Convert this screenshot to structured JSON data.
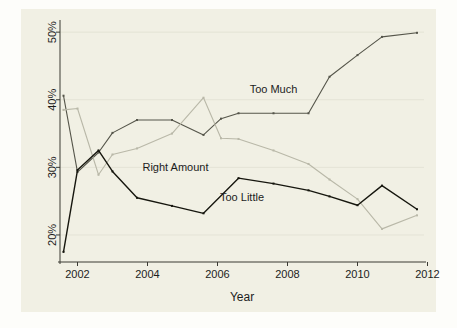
{
  "chart_data": {
    "type": "line",
    "title": "",
    "subtitle": "",
    "xlabel": "Year",
    "ylabel": "",
    "xlim": [
      2001.5,
      2011.9
    ],
    "ylim": [
      16.0,
      51.5
    ],
    "grid": true,
    "grid_axis": "y",
    "legend": "inline-labels",
    "legend_position": "inline",
    "xticks": [
      2002,
      2004,
      2006,
      2008,
      2010,
      2012
    ],
    "xticklabels": [
      "2002",
      "2004",
      "2006",
      "2008",
      "2010",
      "2012"
    ],
    "yticks": [
      20,
      30,
      40,
      50
    ],
    "yticklabels": [
      "20%",
      "30%",
      "40%",
      "50%"
    ],
    "series": [
      {
        "name": "Too Much",
        "color": "#55554a",
        "label_text": "Too Much",
        "label_x": 2007.6,
        "label_y": 41.0,
        "x": [
          2001.6,
          2002.0,
          2002.6,
          2003.0,
          2003.7,
          2004.7,
          2005.6,
          2006.1,
          2006.6,
          2007.6,
          2008.6,
          2009.2,
          2010.0,
          2010.7,
          2011.7
        ],
        "values": [
          40.6,
          29.3,
          32.2,
          35.1,
          37.0,
          37.0,
          34.8,
          37.2,
          38.0,
          38.0,
          38.0,
          43.4,
          46.6,
          49.3,
          49.9
        ]
      },
      {
        "name": "Right Amount",
        "color": "#b9b8a8",
        "label_text": "Right Amount",
        "label_x": 2004.8,
        "label_y": 29.5,
        "x": [
          2001.6,
          2002.0,
          2002.6,
          2003.0,
          2003.7,
          2004.7,
          2005.6,
          2006.1,
          2006.6,
          2007.6,
          2008.6,
          2009.2,
          2010.0,
          2010.7,
          2011.7
        ],
        "values": [
          38.5,
          38.7,
          28.9,
          31.9,
          32.8,
          35.0,
          40.3,
          34.3,
          34.2,
          32.5,
          30.5,
          28.2,
          25.3,
          20.9,
          22.9
        ]
      },
      {
        "name": "Too Little",
        "color": "#16160e",
        "label_text": "Too Little",
        "label_x": 2006.7,
        "label_y": 25.0,
        "x": [
          2001.6,
          2002.0,
          2002.6,
          2003.0,
          2003.7,
          2004.7,
          2005.6,
          2006.6,
          2007.6,
          2008.6,
          2009.2,
          2010.0,
          2010.7,
          2011.7
        ],
        "values": [
          17.5,
          29.6,
          32.5,
          29.4,
          25.5,
          24.3,
          23.2,
          28.4,
          27.6,
          26.6,
          25.7,
          24.4,
          27.3,
          23.8
        ]
      }
    ]
  }
}
